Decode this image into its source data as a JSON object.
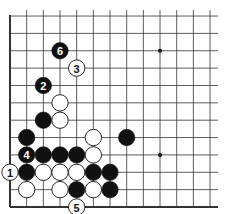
{
  "diagram": {
    "type": "go-board-excerpt",
    "view": "lower-left corner",
    "columns_visible": 13,
    "rows_visible": 12,
    "edges": {
      "left": true,
      "bottom": true,
      "top": false,
      "right": false
    },
    "colors": {
      "black": "#111111",
      "white": "#ffffff",
      "line": "#333333",
      "background": "#ffffff"
    },
    "star_points": [
      {
        "col": 9,
        "row": 9
      },
      {
        "col": 9,
        "row": 3
      }
    ],
    "stones": [
      {
        "col": 3,
        "row": 9,
        "color": "black",
        "label": "6"
      },
      {
        "col": 4,
        "row": 8,
        "color": "white",
        "label": "3"
      },
      {
        "col": 2,
        "row": 7,
        "color": "black",
        "label": "2"
      },
      {
        "col": 3,
        "row": 6,
        "color": "white",
        "label": ""
      },
      {
        "col": 2,
        "row": 5,
        "color": "black",
        "label": ""
      },
      {
        "col": 3,
        "row": 5,
        "color": "white",
        "label": ""
      },
      {
        "col": 1,
        "row": 4,
        "color": "black",
        "label": ""
      },
      {
        "col": 5,
        "row": 4,
        "color": "white",
        "label": ""
      },
      {
        "col": 7,
        "row": 4,
        "color": "black",
        "label": ""
      },
      {
        "col": 1,
        "row": 3,
        "color": "black",
        "label": "4"
      },
      {
        "col": 2,
        "row": 3,
        "color": "black",
        "label": ""
      },
      {
        "col": 3,
        "row": 3,
        "color": "black",
        "label": ""
      },
      {
        "col": 4,
        "row": 3,
        "color": "black",
        "label": ""
      },
      {
        "col": 5,
        "row": 3,
        "color": "white",
        "label": ""
      },
      {
        "col": 0,
        "row": 2,
        "color": "white",
        "label": "1"
      },
      {
        "col": 1,
        "row": 2,
        "color": "black",
        "label": ""
      },
      {
        "col": 2,
        "row": 2,
        "color": "white",
        "label": ""
      },
      {
        "col": 3,
        "row": 2,
        "color": "white",
        "label": ""
      },
      {
        "col": 4,
        "row": 2,
        "color": "white",
        "label": ""
      },
      {
        "col": 5,
        "row": 2,
        "color": "black",
        "label": ""
      },
      {
        "col": 6,
        "row": 2,
        "color": "black",
        "label": ""
      },
      {
        "col": 1,
        "row": 1,
        "color": "white",
        "label": ""
      },
      {
        "col": 3,
        "row": 1,
        "color": "white",
        "label": ""
      },
      {
        "col": 4,
        "row": 1,
        "color": "black",
        "label": ""
      },
      {
        "col": 5,
        "row": 1,
        "color": "white",
        "label": ""
      },
      {
        "col": 6,
        "row": 1,
        "color": "black",
        "label": ""
      },
      {
        "col": 4,
        "row": 0,
        "color": "white",
        "label": "5"
      }
    ]
  }
}
